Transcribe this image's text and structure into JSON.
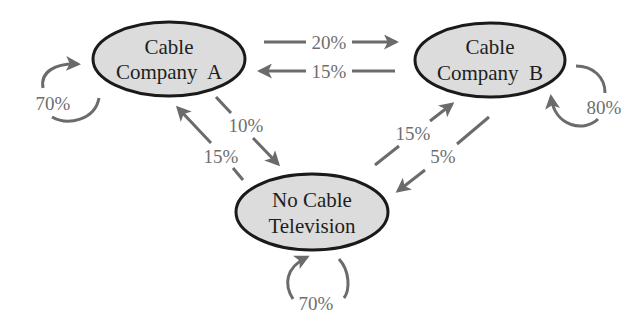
{
  "diagram": {
    "type": "state-transition",
    "nodes": [
      {
        "id": "A",
        "line1": "Cable",
        "line2": "Company  A"
      },
      {
        "id": "B",
        "line1": "Cable",
        "line2": "Company  B"
      },
      {
        "id": "N",
        "line1": "No Cable",
        "line2": "Television"
      }
    ],
    "edges": {
      "A_to_A": "70%",
      "A_to_B": "20%",
      "B_to_A": "15%",
      "A_to_N": "10%",
      "N_to_A": "15%",
      "B_to_B": "80%",
      "N_to_B": "15%",
      "B_to_N": "5%",
      "N_to_N": "70%"
    },
    "colors": {
      "node_fill": "#dcdcdc",
      "node_stroke": "#1a1a1a",
      "edge": "#6b6b6b",
      "label": "#6e6e6e"
    }
  }
}
